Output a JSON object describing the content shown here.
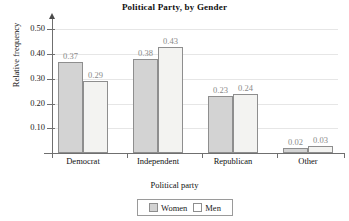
{
  "chart_data": {
    "type": "bar",
    "title": "Political Party, by Gender",
    "xlabel": "Political party",
    "ylabel": "Relative frequency",
    "categories": [
      "Democrat",
      "Independent",
      "Republican",
      "Other"
    ],
    "series": [
      {
        "name": "Women",
        "values": [
          0.37,
          0.38,
          0.23,
          0.02
        ],
        "color": "#d3d3d3"
      },
      {
        "name": "Men",
        "values": [
          0.29,
          0.43,
          0.24,
          0.03
        ],
        "color": "#f3f3f1"
      }
    ],
    "value_labels": [
      [
        "0.37",
        "0.29"
      ],
      [
        "0.38",
        "0.43"
      ],
      [
        "0.23",
        "0.24"
      ],
      [
        "0.02",
        "0.03"
      ]
    ],
    "ylim": [
      0.0,
      0.55
    ],
    "yticks": [
      0.1,
      0.2,
      0.3,
      0.4,
      0.5
    ],
    "ytick_labels": [
      "0.10",
      "0.20",
      "0.30",
      "0.40",
      "0.50"
    ],
    "grid": true,
    "legend_position": "bottom-center",
    "legend_entries": [
      "Women",
      "Men"
    ]
  }
}
